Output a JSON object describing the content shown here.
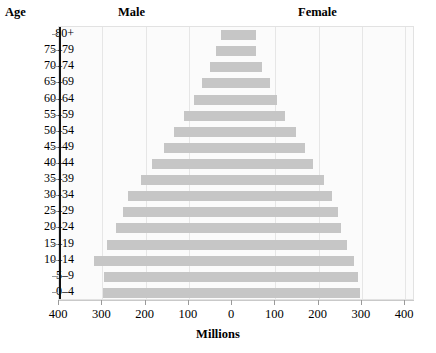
{
  "header": {
    "age_label": "Age",
    "male_label": "Male",
    "female_label": "Female"
  },
  "axis": {
    "x_title": "Millions",
    "x_ticks": [
      "400",
      "300",
      "200",
      "100",
      "0",
      "100",
      "200",
      "300",
      "400"
    ]
  },
  "chart_data": {
    "type": "bar",
    "subtype": "population-pyramid",
    "title": "",
    "xlabel": "Millions",
    "ylabel": "Age",
    "xlim": [
      -400,
      400
    ],
    "grid": true,
    "legend": [
      "Male",
      "Female"
    ],
    "legend_position": "top",
    "categories": [
      "80+",
      "75–79",
      "70–74",
      "65–69",
      "60–64",
      "55–59",
      "50–54",
      "45–49",
      "40–44",
      "35–39",
      "30–34",
      "25–29",
      "20–24",
      "15–19",
      "10–14",
      "5–9",
      "0–4"
    ],
    "series": [
      {
        "name": "Male",
        "direction": "left",
        "values": [
          26,
          38,
          52,
          70,
          88,
          110,
          135,
          158,
          185,
          210,
          240,
          252,
          268,
          288,
          318,
          295,
          298
        ]
      },
      {
        "name": "Female",
        "direction": "right",
        "values": [
          55,
          55,
          70,
          88,
          105,
          122,
          148,
          168,
          188,
          212,
          232,
          245,
          252,
          265,
          282,
          292,
          295
        ]
      }
    ]
  },
  "bottom_cutoff_text": ""
}
